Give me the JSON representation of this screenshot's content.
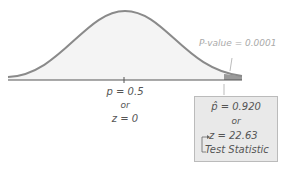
{
  "diagram": {
    "type": "normal-distribution-hypothesis-test",
    "null_center": {
      "line1": "p = 0.5",
      "line2": "or",
      "line3": "z = 0"
    },
    "p_value_label": "P-value = 0.0001",
    "observed": {
      "line1": "p̂ = 0.920",
      "line2": "or",
      "line3": "z = 22.63",
      "caption": "Test Statistic"
    },
    "colors": {
      "curve": "#8a8a8a",
      "fill": "#f3f3f3",
      "tail": "#999999",
      "axis": "#555555",
      "box": "#e9e9e9"
    }
  }
}
